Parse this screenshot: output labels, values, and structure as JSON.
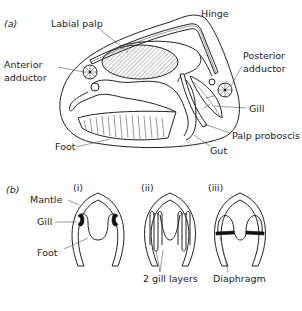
{
  "figure": {
    "panel_a": {
      "label": "(a)",
      "labels": {
        "hinge": "Hinge",
        "labial_palp": "Labial palp",
        "anterior_adductor_1": "Anterior",
        "anterior_adductor_2": "adductor",
        "posterior_adductor_1": "Posterior",
        "posterior_adductor_2": "adductor",
        "gill": "Gill",
        "palp_proboscis": "Palp proboscis",
        "gut": "Gut",
        "foot": "Foot"
      }
    },
    "panel_b": {
      "label": "(b)",
      "subpanels": [
        {
          "label": "(i)"
        },
        {
          "label": "(ii)"
        },
        {
          "label": "(iii)"
        }
      ],
      "labels": {
        "mantle": "Mantle",
        "gill": "Gill",
        "foot": "Foot",
        "gill_layers": "2 gill layers",
        "diaphragm": "Diaphragm"
      }
    }
  }
}
